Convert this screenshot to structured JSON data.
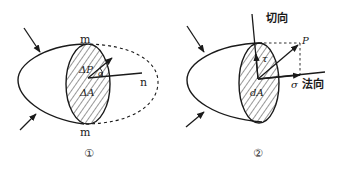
{
  "figure_1": {
    "caption": "①",
    "labels": {
      "m_top": "m",
      "m_bottom": "m",
      "delta_p": "ΔP",
      "delta_a": "ΔA",
      "normal": "n",
      "angle": "α"
    }
  },
  "figure_2": {
    "caption": "②",
    "labels": {
      "tangential": "切向",
      "normal": "法向",
      "p": "P",
      "tau": "τ",
      "sigma": "σ",
      "da": "dA"
    }
  },
  "colors": {
    "stroke": "#1a1a1a",
    "background": "#ffffff"
  }
}
